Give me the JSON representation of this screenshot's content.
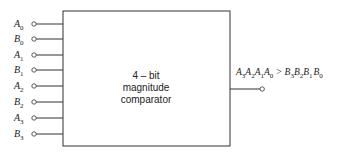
{
  "diagram": {
    "block": {
      "line1": "4 – bit",
      "line2": "magnitude",
      "line3": "comparator"
    },
    "inputs": [
      {
        "letter": "A",
        "sub": "0"
      },
      {
        "letter": "B",
        "sub": "0"
      },
      {
        "letter": "A",
        "sub": "1"
      },
      {
        "letter": "B",
        "sub": "1"
      },
      {
        "letter": "A",
        "sub": "2"
      },
      {
        "letter": "B",
        "sub": "2"
      },
      {
        "letter": "A",
        "sub": "3"
      },
      {
        "letter": "B",
        "sub": "3"
      }
    ],
    "output": {
      "lhs": [
        {
          "letter": "A",
          "sub": "3"
        },
        {
          "letter": "A",
          "sub": "2"
        },
        {
          "letter": "A",
          "sub": "1"
        },
        {
          "letter": "A",
          "sub": "0"
        }
      ],
      "operator": ">",
      "rhs": [
        {
          "letter": "B",
          "sub": "3"
        },
        {
          "letter": "B",
          "sub": "2"
        },
        {
          "letter": "B",
          "sub": "1"
        },
        {
          "letter": "B",
          "sub": "0"
        }
      ]
    },
    "colors": {
      "stroke": "#333333",
      "background": "#ffffff"
    }
  }
}
